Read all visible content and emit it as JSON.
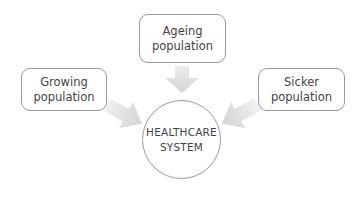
{
  "diagram": {
    "type": "convergent-influence",
    "center": {
      "line1": "HEALTHCARE",
      "line2": "SYSTEM"
    },
    "inputs": [
      {
        "id": "ageing",
        "line1": "Ageing",
        "line2": "population",
        "position": "top"
      },
      {
        "id": "growing",
        "line1": "Growing",
        "line2": "population",
        "position": "left"
      },
      {
        "id": "sicker",
        "line1": "Sicker",
        "line2": "population",
        "position": "right"
      }
    ],
    "colors": {
      "border": "#9a9a9a",
      "arrow": "#d9d9d9",
      "text": "#444444",
      "background": "#ffffff"
    }
  }
}
